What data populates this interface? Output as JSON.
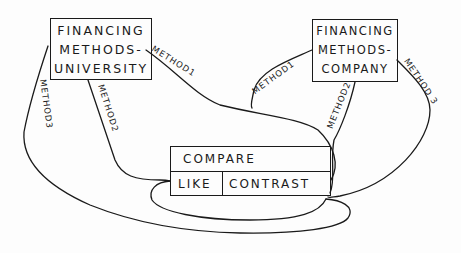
{
  "diagram": {
    "nodes": {
      "university": {
        "lines": [
          "FINANCING",
          "METHODS-",
          "UNIVERSITY"
        ]
      },
      "company": {
        "lines": [
          "FINANCING",
          "METHODS-",
          "COMPANY"
        ]
      },
      "compare": {
        "header": "COMPARE",
        "columns": [
          "LIKE",
          "CONTRAST"
        ]
      }
    },
    "edges": {
      "uni_method1": "METHOD1",
      "uni_method2": "METHOD2",
      "uni_method3": "METHOD3",
      "co_method1": "METHOD1",
      "co_method2": "METHOD2",
      "co_method3": "METHOD 3"
    },
    "stroke_color": "#1a1a1a",
    "background": "#fdfdfd"
  }
}
